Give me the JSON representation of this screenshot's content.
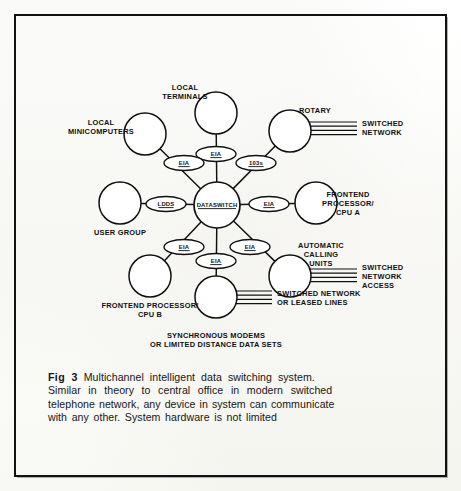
{
  "figure": {
    "frame_color": "#121212",
    "ink_color": "#101010",
    "paper_color": "#fdfdfb"
  },
  "diagram": {
    "hub": {
      "label": "DATASWITCH",
      "cx": 217,
      "cy": 205,
      "r": 23
    },
    "nodes": [
      {
        "id": "local-terminals",
        "label_lines": [
          "LOCAL",
          "TERMINALS"
        ],
        "cx": 216,
        "cy": 113,
        "r": 21,
        "label_x": 185,
        "label_y": 90,
        "label_anchor": "middle"
      },
      {
        "id": "local-minicomputers",
        "label_lines": [
          "LOCAL",
          "MINICOMPUTERS"
        ],
        "cx": 145,
        "cy": 134,
        "r": 21,
        "label_x": 101,
        "label_y": 125,
        "label_anchor": "middle"
      },
      {
        "id": "rotary",
        "label_lines": [
          "ROTARY"
        ],
        "cx": 290,
        "cy": 131,
        "r": 21,
        "label_x": 299,
        "label_y": 113,
        "label_anchor": "start"
      },
      {
        "id": "user-group",
        "label_lines": [
          "USER GROUP"
        ],
        "cx": 120,
        "cy": 203,
        "r": 21,
        "label_x": 120,
        "label_y": 235,
        "label_anchor": "middle"
      },
      {
        "id": "frontend-processor-cpu-a",
        "label_lines": [
          "FRONTEND",
          "PROCESSOR/",
          "CPU A"
        ],
        "cx": 316,
        "cy": 203,
        "r": 21,
        "label_x": 348,
        "label_y": 197,
        "label_anchor": "middle"
      },
      {
        "id": "frontend-processor-cpu-b",
        "label_lines": [
          "FRONTEND PROCESSOR/",
          "CPU B"
        ],
        "cx": 150,
        "cy": 276,
        "r": 21,
        "label_x": 150,
        "label_y": 308,
        "label_anchor": "middle"
      },
      {
        "id": "automatic-calling-units",
        "label_lines": [
          "AUTOMATIC",
          "CALLING",
          "UNITS"
        ],
        "cx": 290,
        "cy": 276,
        "r": 21,
        "label_x": 321,
        "label_y": 248,
        "label_anchor": "middle"
      },
      {
        "id": "synchronous-modems",
        "label_lines": [
          "SYNCHRONOUS MODEMS",
          "OR LIMITED DISTANCE DATA SETS"
        ],
        "cx": 216,
        "cy": 297,
        "r": 21,
        "label_x": 216,
        "label_y": 338,
        "label_anchor": "middle"
      }
    ],
    "interface_pills": [
      {
        "id": "pill-local-terminals",
        "label": "EIA",
        "cx": 216,
        "cy": 154,
        "rx": 20,
        "ry": 7.5
      },
      {
        "id": "pill-local-minicomputers",
        "label": "EIA",
        "cx": 184,
        "cy": 163,
        "rx": 20,
        "ry": 7.5
      },
      {
        "id": "pill-rotary",
        "label": "103s",
        "cx": 256,
        "cy": 163,
        "rx": 20,
        "ry": 7.5
      },
      {
        "id": "pill-user-group",
        "label": "LDDS",
        "cx": 166,
        "cy": 204,
        "rx": 20,
        "ry": 7.5
      },
      {
        "id": "pill-frontend-cpu-a",
        "label": "EIA",
        "cx": 269,
        "cy": 204,
        "rx": 20,
        "ry": 7.5
      },
      {
        "id": "pill-frontend-cpu-b",
        "label": "EIA",
        "cx": 184,
        "cy": 247,
        "rx": 20,
        "ry": 7.5
      },
      {
        "id": "pill-automatic-calling-units",
        "label": "EIA",
        "cx": 250,
        "cy": 247,
        "rx": 20,
        "ry": 7.5
      },
      {
        "id": "pill-synchronous-modems",
        "label": "EIA",
        "cx": 216,
        "cy": 261,
        "rx": 20,
        "ry": 7.5
      }
    ],
    "trunk_groups": [
      {
        "id": "trunk-switched-network",
        "label_lines": [
          "SWITCHED",
          "NETWORK"
        ],
        "from_x": 308,
        "to_x": 357,
        "y_start": 122,
        "line_count": 4,
        "line_gap": 4.2,
        "label_x": 362,
        "label_y": 126,
        "label_anchor": "start"
      },
      {
        "id": "trunk-switched-network-access",
        "label_lines": [
          "SWITCHED",
          "NETWORK",
          "ACCESS"
        ],
        "from_x": 308,
        "to_x": 357,
        "y_start": 269,
        "line_count": 4,
        "line_gap": 4.2,
        "label_x": 362,
        "label_y": 270,
        "label_anchor": "start"
      },
      {
        "id": "trunk-switched-network-or-leased-lines",
        "label_lines": [
          "SWITCHED NETWORK",
          "OR LEASED LINES"
        ],
        "from_x": 234,
        "to_x": 272,
        "y_start": 291,
        "line_count": 4,
        "line_gap": 4.2,
        "label_x": 277,
        "label_y": 296,
        "label_anchor": "start"
      }
    ]
  },
  "caption": {
    "fig_number": "Fig 3",
    "line1": "Multichannel intelligent data switching system.",
    "line2": "Similar in theory to central office in modern switched",
    "line3": "telephone network, any device in system can communicate",
    "line4": "with any other. System hardware is not limited",
    "full_text": "Fig 3 Multichannel intelligent data switching system. Similar in theory to central office in modern switched telephone network, any device in system can communicate with any other. System hardware is not limited"
  }
}
